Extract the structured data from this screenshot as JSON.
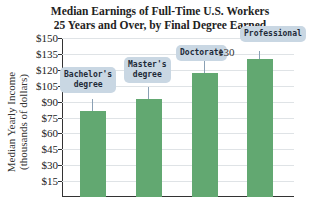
{
  "chart_data": {
    "type": "bar",
    "title_lines": [
      "Median Earnings of Full-Time U.S. Workers",
      "25 Years and Over, by Final Degree Earned"
    ],
    "xlabel": "",
    "ylabel": "Median Yearly Income (thousands of dollars)",
    "ylabel_lines": [
      "Median Yearly Income",
      "(thousands of dollars)"
    ],
    "categories": [
      "Bachelor's degree",
      "Master's degree",
      "Doctorate",
      "Professional"
    ],
    "values": [
      81,
      92,
      117,
      130
    ],
    "annotations": [
      {
        "category": "Professional",
        "text": "130"
      }
    ],
    "ylim": [
      0,
      150
    ],
    "yticks": [
      "$15",
      "$30",
      "$45",
      "$60",
      "$75",
      "$90",
      "$105",
      "$120",
      "$135",
      "$150"
    ],
    "grid": true,
    "legend": "none",
    "bar_color": "#62a871"
  }
}
